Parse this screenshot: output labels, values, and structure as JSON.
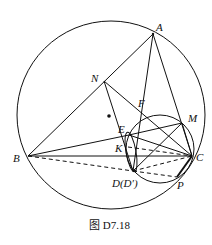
{
  "figure": {
    "caption": "图 D7.18",
    "labels": {
      "A": "A",
      "N": "N",
      "F": "F",
      "M": "M",
      "E": "E",
      "K": "K",
      "B": "B",
      "C": "C",
      "D": "D(D′)",
      "P": "P"
    }
  },
  "points": {
    "A": [
      153,
      34
    ],
    "N": [
      104,
      81
    ],
    "B": [
      28,
      156
    ],
    "C": [
      192,
      156
    ],
    "M": [
      182,
      123
    ],
    "E": [
      129,
      135
    ],
    "K": [
      128,
      147
    ],
    "D": [
      133,
      171
    ],
    "P": [
      177,
      177
    ],
    "F": [
      140,
      108
    ],
    "O": [
      109,
      116
    ]
  },
  "circles": {
    "circumcircle": {
      "cx": 111,
      "cy": 115,
      "r": 94
    },
    "small": {
      "cx": 160,
      "cy": 149,
      "r": 34
    }
  }
}
